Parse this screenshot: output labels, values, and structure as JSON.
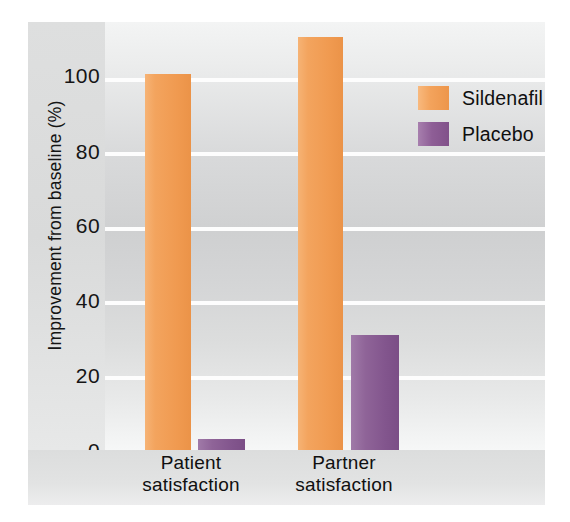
{
  "chart_data": {
    "type": "bar",
    "title": "",
    "subtitle": "",
    "xlabel": "",
    "ylabel": "Improvement from baseline (%)",
    "ylim": [
      0,
      115
    ],
    "yticks": [
      0,
      20,
      40,
      60,
      80,
      100
    ],
    "ytick_labels": [
      "0",
      "20",
      "40",
      "60",
      "80",
      "100"
    ],
    "grid": "horizontal-white-gridlines",
    "categories": [
      "Patient satisfaction",
      "Partner satisfaction"
    ],
    "category_lines": [
      [
        "Patient",
        "satisfaction"
      ],
      [
        "Partner",
        "satisfaction"
      ]
    ],
    "legend_position": "top-right",
    "series": [
      {
        "name": "Sildenafil",
        "color": "#F2A05A",
        "values": [
          101,
          111
        ]
      },
      {
        "name": "Placebo",
        "color": "#8E5E96",
        "values": [
          3,
          31
        ]
      }
    ]
  },
  "legend": {
    "entries": [
      {
        "label": "Sildenafil",
        "swatch": "sildenafil-swatch-icon"
      },
      {
        "label": "Placebo",
        "swatch": "placebo-swatch-icon"
      }
    ]
  },
  "axes": {
    "y_label": "Improvement from baseline (%)",
    "y_ticks": [
      "100",
      "80",
      "60",
      "40",
      "20",
      "0"
    ],
    "x_labels": [
      {
        "line1": "Patient",
        "line2": "satisfaction"
      },
      {
        "line1": "Partner",
        "line2": "satisfaction"
      }
    ]
  },
  "colors": {
    "sildenafil": "#F2A05A",
    "placebo": "#8E5E96",
    "gridline": "#FDFDFD",
    "plot_background": "#D8D9DA",
    "figure_background": "#E7E8E8"
  }
}
